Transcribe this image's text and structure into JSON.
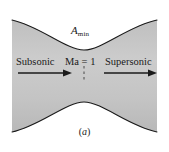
{
  "figure": {
    "type": "converging-diverging-nozzle-cross-section",
    "caption": "(a)",
    "caption_open_paren": "(",
    "caption_letter": "a",
    "caption_close_paren": ")",
    "background_color": "#ffffff",
    "flow_region_color": "#c9c9c9",
    "wall_line_color": "#1a1a1a",
    "text_color": "#1a1a1a"
  },
  "labels": {
    "throat_area": {
      "base": "A",
      "subscript": "min",
      "full": "A_min"
    },
    "left_region": "Subsonic",
    "throat_region": "Ma = 1",
    "right_region": "Supersonic"
  },
  "annotations": {
    "left_arrow_direction": "right",
    "right_arrow_direction": "right",
    "throat_dashed_line": "vertical dashed centerline at throat"
  }
}
